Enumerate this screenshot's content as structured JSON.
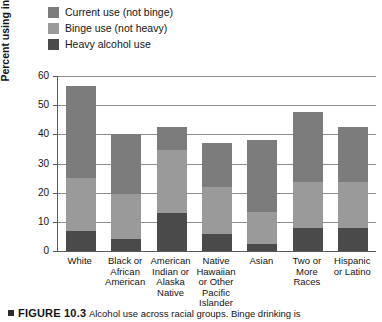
{
  "chart_data": {
    "type": "bar",
    "subtype": "stacked-bar",
    "title": "",
    "xlabel": "",
    "ylabel": "Percent using in past month",
    "ylim": [
      0,
      60
    ],
    "ytick_step": 10,
    "yticks": [
      "0",
      "10",
      "20",
      "30",
      "40",
      "50",
      "60"
    ],
    "grid": "horizontal",
    "legend_position": "top-left",
    "categories": [
      "White",
      "Black or African American",
      "American Indian or Alaska Native",
      "Native Hawaiian or Other Pacific Islander",
      "Asian",
      "Two or More Races",
      "Hispanic or Latino"
    ],
    "category_lines": [
      [
        "White"
      ],
      [
        "Black or",
        "African",
        "American"
      ],
      [
        "American",
        "Indian or",
        "Alaska",
        "Native"
      ],
      [
        "Native",
        "Hawaiian",
        "or Other",
        "Pacific",
        "Islander"
      ],
      [
        "Asian"
      ],
      [
        "Two or",
        "More",
        "Races"
      ],
      [
        "Hispanic",
        "or Latino"
      ]
    ],
    "series": [
      {
        "name": "Heavy alcohol use",
        "color": "#4a4a4a",
        "values": [
          7.0,
          4.0,
          13.0,
          6.0,
          2.5,
          8.0,
          8.0
        ]
      },
      {
        "name": "Binge use (not heavy)",
        "color": "#9a9a9a",
        "values": [
          18.0,
          15.5,
          21.5,
          16.0,
          11.0,
          15.5,
          15.5
        ]
      },
      {
        "name": "Current use (not binge)",
        "color": "#7c7c7c",
        "values": [
          31.5,
          20.5,
          8.0,
          15.0,
          24.5,
          24.0,
          19.0
        ]
      }
    ],
    "stack_tops": [
      56.5,
      40.0,
      42.5,
      37.0,
      38.0,
      47.5,
      42.5
    ],
    "segment_boundaries": {
      "heavy_top": [
        7.0,
        4.0,
        13.0,
        6.0,
        2.5,
        8.0,
        8.0
      ],
      "binge_top": [
        25.0,
        19.5,
        34.5,
        22.0,
        13.5,
        23.5,
        23.5
      ],
      "total": [
        56.5,
        40.0,
        42.5,
        37.0,
        38.0,
        47.5,
        42.5
      ]
    }
  },
  "legend": {
    "items": [
      {
        "label": "Current use (not binge)",
        "color": "#7c7c7c"
      },
      {
        "label": "Binge use (not heavy)",
        "color": "#9a9a9a"
      },
      {
        "label": "Heavy alcohol use",
        "color": "#4a4a4a"
      }
    ]
  },
  "caption": {
    "figure_number": "FIGURE 10.3",
    "text": "Alcohol use across racial groups. Binge drinking is"
  },
  "colors": {
    "axis": "#5a5a5a",
    "grid": "#8e8e8e",
    "text": "#141414",
    "background": "#ffffff"
  }
}
